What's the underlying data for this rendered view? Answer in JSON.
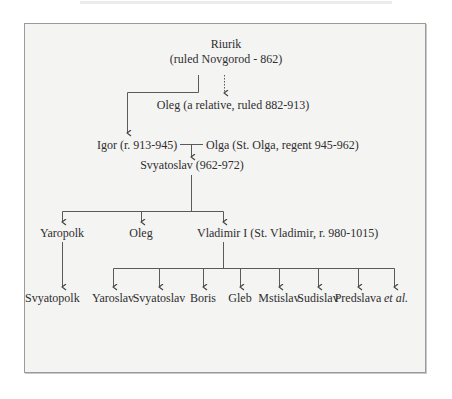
{
  "diagram": {
    "type": "family-tree",
    "colors": {
      "frame_bg": "#f4f4f3",
      "frame_border": "#9a9a9a",
      "text": "#2e2e2e",
      "line": "#555555"
    },
    "root": {
      "name": "Riurik",
      "note": "(ruled Novgorod - 862)"
    },
    "gen1": {
      "relative": "Oleg (a relative, ruled 882-913)"
    },
    "gen2": {
      "igor": "Igor (r. 913-945)",
      "olga": "Olga (St. Olga, regent 945-962)"
    },
    "gen3": {
      "svyatoslav": "Svyatoslav (962-972)"
    },
    "gen4": [
      {
        "label": "Yaropolk"
      },
      {
        "label": "Oleg"
      },
      {
        "label": "Vladimir I (St. Vladimir, r. 980-1015)"
      }
    ],
    "gen5_yaropolk": {
      "label": "Svyatopolk"
    },
    "gen5_vladimir": [
      {
        "label": "Yaroslav"
      },
      {
        "label": "Svyatoslav"
      },
      {
        "label": "Boris"
      },
      {
        "label": "Gleb"
      },
      {
        "label": "Mstislav"
      },
      {
        "label": "Sudislav"
      },
      {
        "label": "Predslava"
      },
      {
        "label": "et al."
      }
    ],
    "edges": [
      {
        "from": "Riurik",
        "to": "Igor",
        "style": "solid"
      },
      {
        "from": "Riurik",
        "to": "Oleg (a relative)",
        "style": "dotted"
      },
      {
        "from": "Igor + Olga",
        "to": "Svyatoslav",
        "style": "solid"
      },
      {
        "from": "Svyatoslav",
        "to": [
          "Yaropolk",
          "Oleg",
          "Vladimir I"
        ],
        "style": "solid"
      },
      {
        "from": "Yaropolk",
        "to": "Svyatopolk",
        "style": "solid"
      },
      {
        "from": "Vladimir I",
        "to": [
          "Yaroslav",
          "Svyatoslav",
          "Boris",
          "Gleb",
          "Mstislav",
          "Sudislav",
          "Predslava",
          "et al."
        ],
        "style": "solid"
      }
    ]
  }
}
